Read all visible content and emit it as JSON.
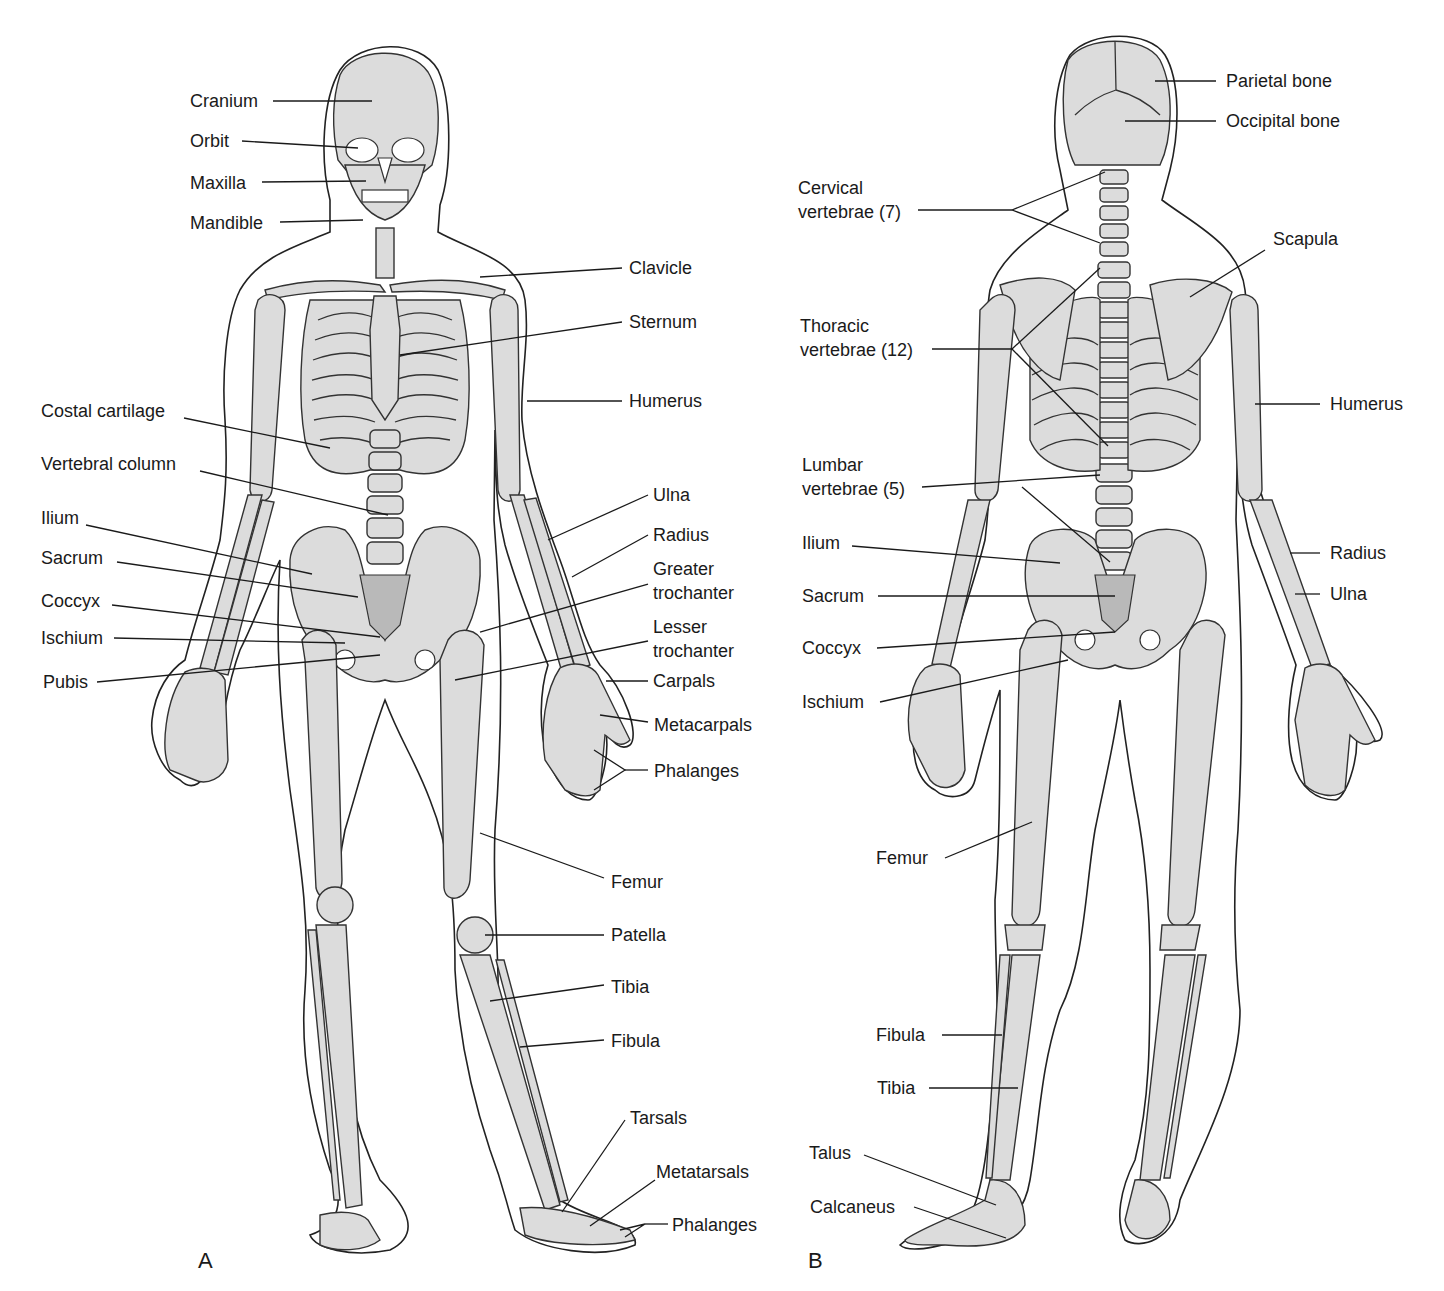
{
  "figure": {
    "colors": {
      "bone_fill": "#dcdcdc",
      "bone_dark": "#b9b9b9",
      "outline": "#333333",
      "background": "#ffffff",
      "text": "#1a1a1a"
    },
    "panels": [
      {
        "id": "A",
        "letter": "A",
        "view": "anterior",
        "labels": [
          {
            "text": "Cranium"
          },
          {
            "text": "Orbit"
          },
          {
            "text": "Maxilla"
          },
          {
            "text": "Mandible"
          },
          {
            "text": "Clavicle"
          },
          {
            "text": "Sternum"
          },
          {
            "text": "Humerus"
          },
          {
            "text": "Costal cartilage"
          },
          {
            "text": "Vertebral column"
          },
          {
            "text": "Ulna"
          },
          {
            "text": "Radius"
          },
          {
            "text": "Ilium"
          },
          {
            "text": "Sacrum"
          },
          {
            "text": "Greater",
            "text2": "trochanter"
          },
          {
            "text": "Coccyx"
          },
          {
            "text": "Lesser",
            "text2": "trochanter"
          },
          {
            "text": "Ischium"
          },
          {
            "text": "Pubis"
          },
          {
            "text": "Carpals"
          },
          {
            "text": "Metacarpals"
          },
          {
            "text": "Phalanges"
          },
          {
            "text": "Femur"
          },
          {
            "text": "Patella"
          },
          {
            "text": "Tibia"
          },
          {
            "text": "Fibula"
          },
          {
            "text": "Tarsals"
          },
          {
            "text": "Metatarsals"
          },
          {
            "text": "Phalanges"
          }
        ]
      },
      {
        "id": "B",
        "letter": "B",
        "view": "posterior",
        "labels": [
          {
            "text": "Parietal bone"
          },
          {
            "text": "Occipital bone"
          },
          {
            "text": "Cervical",
            "text2": "vertebrae (7)"
          },
          {
            "text": "Scapula"
          },
          {
            "text": "Thoracic",
            "text2": "vertebrae (12)"
          },
          {
            "text": "Humerus"
          },
          {
            "text": "Lumbar",
            "text2": "vertebrae (5)"
          },
          {
            "text": "Ilium"
          },
          {
            "text": "Radius"
          },
          {
            "text": "Sacrum"
          },
          {
            "text": "Ulna"
          },
          {
            "text": "Coccyx"
          },
          {
            "text": "Ischium"
          },
          {
            "text": "Femur"
          },
          {
            "text": "Fibula"
          },
          {
            "text": "Tibia"
          },
          {
            "text": "Talus"
          },
          {
            "text": "Calcaneus"
          }
        ]
      }
    ]
  }
}
